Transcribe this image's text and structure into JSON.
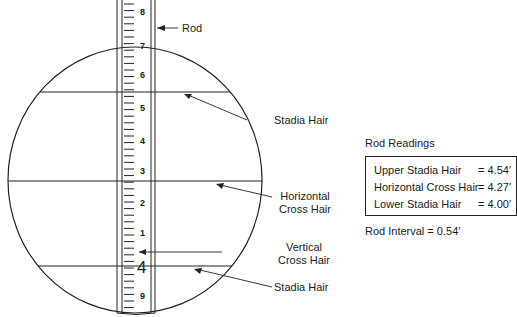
{
  "diagram": {
    "rod_label": "Rod",
    "rod_numbers": [
      {
        "text": "8",
        "y": 13
      },
      {
        "text": "7",
        "y": 47
      },
      {
        "text": "6",
        "y": 76
      },
      {
        "text": "5",
        "y": 109
      },
      {
        "text": "4",
        "y": 142
      },
      {
        "text": "3",
        "y": 172
      },
      {
        "text": "2",
        "y": 204
      },
      {
        "text": "1",
        "y": 234
      },
      {
        "text": "4",
        "y": 268,
        "large": true
      },
      {
        "text": "9",
        "y": 297
      }
    ],
    "callouts": {
      "upper_stadia": "Stadia Hair",
      "horizontal_line1": "Horizontal",
      "horizontal_line2": "Cross Hair",
      "vertical_line1": "Vertical",
      "vertical_line2": "Cross Hair",
      "lower_stadia": "Stadia Hair"
    }
  },
  "readings": {
    "title": "Rod Readings",
    "rows": [
      {
        "label": "Upper Stadia Hair",
        "value": "= 4.54′"
      },
      {
        "label": "Horizontal Cross Hair",
        "value": "= 4.27′"
      },
      {
        "label": "Lower Stadia Hair",
        "value": "= 4.00′"
      }
    ],
    "interval": "Rod Interval = 0.54′"
  }
}
